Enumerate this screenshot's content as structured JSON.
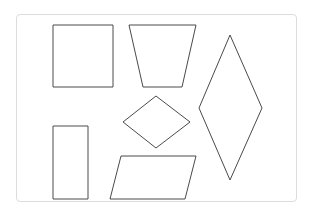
{
  "figure": {
    "stroke_color": "#4a4a4a",
    "card_border_color": "#dcdcdc",
    "shapes": [
      {
        "name": "square",
        "points": "53,25 113,25 113,87 53,87"
      },
      {
        "name": "trapezoid",
        "points": "129,25 196,25 182,87 143,87"
      },
      {
        "name": "large-rhombus",
        "points": "230,35 262,108 230,180 199,108"
      },
      {
        "name": "small-rhombus",
        "points": "156,96 190,122 156,148 123,122"
      },
      {
        "name": "rectangle",
        "points": "53,126 88,126 88,199 53,199"
      },
      {
        "name": "parallelogram",
        "points": "121,156 196,156 185,199 110,199"
      }
    ]
  }
}
